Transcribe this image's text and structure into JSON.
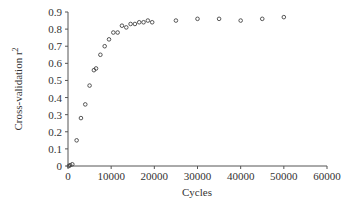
{
  "chart_data": {
    "type": "scatter",
    "title": "",
    "xlabel": "Cycles",
    "ylabel": "Cross-validation r",
    "ylabel_superscript": "2",
    "xlim": [
      0,
      60000
    ],
    "ylim": [
      0,
      0.9
    ],
    "x_ticks": [
      0,
      10000,
      20000,
      30000,
      40000,
      50000,
      60000
    ],
    "x_tick_labels": [
      "0",
      "10000",
      "20000",
      "30000",
      "40000",
      "50000",
      "60000"
    ],
    "y_ticks": [
      0,
      0.1,
      0.2,
      0.3,
      0.4,
      0.5,
      0.6,
      0.7,
      0.8,
      0.9
    ],
    "y_tick_labels": [
      "0",
      "0.1",
      "0.2",
      "0.3",
      "0.4",
      "0.5",
      "0.6",
      "0.7",
      "0.8",
      "0.9"
    ],
    "grid": false,
    "legend": null,
    "marker": "open-circle",
    "series": [
      {
        "name": "Cross-validation r2",
        "points": [
          [
            200,
            0.0
          ],
          [
            500,
            0.005
          ],
          [
            1000,
            0.01
          ],
          [
            2000,
            0.15
          ],
          [
            3000,
            0.28
          ],
          [
            4000,
            0.36
          ],
          [
            5000,
            0.47
          ],
          [
            6000,
            0.56
          ],
          [
            6500,
            0.57
          ],
          [
            7500,
            0.65
          ],
          [
            8500,
            0.7
          ],
          [
            9500,
            0.74
          ],
          [
            10500,
            0.78
          ],
          [
            11500,
            0.78
          ],
          [
            12500,
            0.82
          ],
          [
            13500,
            0.81
          ],
          [
            14500,
            0.83
          ],
          [
            15500,
            0.83
          ],
          [
            16500,
            0.84
          ],
          [
            17500,
            0.84
          ],
          [
            18500,
            0.85
          ],
          [
            19500,
            0.84
          ],
          [
            25000,
            0.85
          ],
          [
            30000,
            0.86
          ],
          [
            35000,
            0.86
          ],
          [
            40000,
            0.85
          ],
          [
            45000,
            0.86
          ],
          [
            50000,
            0.87
          ]
        ]
      }
    ]
  },
  "colors": {
    "axis": "#555555",
    "marker": "#444444",
    "text": "#333333"
  }
}
